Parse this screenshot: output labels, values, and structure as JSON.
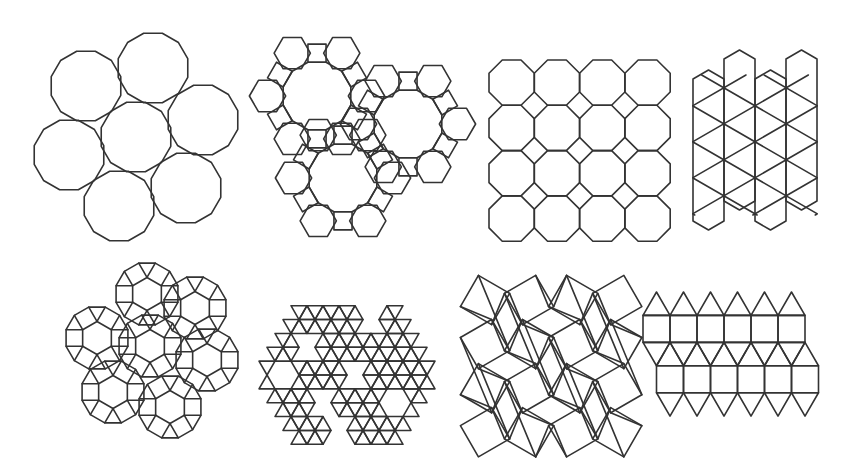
{
  "figure": {
    "width": 849,
    "height": 462,
    "background": "#ffffff",
    "stroke_color": "#333333",
    "panels": [
      {
        "id": "panel-1",
        "name": "truncated-hexagonal-tiling",
        "vertex_config": "3.12.12",
        "kind": "dodecagon-flower",
        "radius": 36,
        "rotation": 15,
        "centers": [
          [
            136,
            137
          ],
          [
            86,
            86
          ],
          [
            153,
            68
          ],
          [
            203,
            120
          ],
          [
            186,
            188
          ],
          [
            119,
            206
          ],
          [
            69,
            155
          ]
        ]
      },
      {
        "id": "panel-2",
        "name": "truncated-trihexagonal-tiling",
        "vertex_config": "4.6.12",
        "kind": "dodecagon-ring",
        "radius": 35,
        "rotation": 15,
        "centers": [
          [
            317,
            96
          ],
          [
            408,
            124
          ],
          [
            343,
            178
          ]
        ]
      },
      {
        "id": "panel-3",
        "name": "truncated-square-tiling",
        "vertex_config": "4.8.8",
        "kind": "octagon-grid",
        "origin": [
          489,
          60
        ],
        "cell": 45.3,
        "cols": 4,
        "rows": 4
      },
      {
        "id": "panel-4",
        "name": "trihexagonal-tiling-strips",
        "vertex_config": "3.6.3.6",
        "kind": "hexagon-strips",
        "origin": [
          693,
          40
        ],
        "strip_width": 31,
        "strips": 4
      },
      {
        "id": "panel-5",
        "name": "dissected-dodecagon-flower",
        "vertex_config": "3.4.6.4",
        "kind": "dissected-dodecagons",
        "radius": 32,
        "rotation": 15,
        "centers": [
          [
            150,
            346
          ],
          [
            147,
            294
          ],
          [
            195,
            308
          ],
          [
            207,
            360
          ],
          [
            170,
            407
          ],
          [
            113,
            392
          ],
          [
            97,
            338
          ]
        ]
      },
      {
        "id": "panel-6",
        "name": "snub-hexagonal-region",
        "vertex_config": "3.3.3.3.6",
        "kind": "triangle-hexagon-field",
        "center": [
          347,
          375
        ],
        "edge": 16
      },
      {
        "id": "panel-7",
        "name": "snub-square-tiling",
        "vertex_config": "3.3.4.3.4",
        "kind": "snub-square",
        "origin": [
          460,
          275
        ],
        "size": 160
      },
      {
        "id": "panel-8",
        "name": "elongated-triangular-tiling",
        "vertex_config": "3.3.3.4.4",
        "kind": "elongated-triangular",
        "origin": [
          643,
          292
        ],
        "edge": 27,
        "columns": 6
      }
    ]
  }
}
